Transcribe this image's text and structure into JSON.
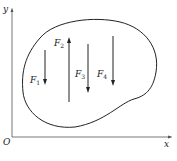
{
  "axes": {
    "x_label": "x",
    "y_label": "y",
    "origin_label": "O"
  },
  "forces": [
    {
      "name": "F",
      "sub": "1",
      "direction": "down"
    },
    {
      "name": "F",
      "sub": "2",
      "direction": "up"
    },
    {
      "name": "F",
      "sub": "3",
      "direction": "down"
    },
    {
      "name": "F",
      "sub": "4",
      "direction": "down"
    }
  ],
  "colors": {
    "stroke": "#222222",
    "axis": "#555555"
  }
}
